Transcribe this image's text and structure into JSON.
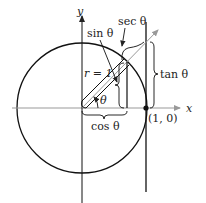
{
  "diagram": {
    "axes": {
      "x_label": "x",
      "y_label": "y"
    },
    "labels": {
      "sin": "sin θ",
      "sec": "sec θ",
      "tan": "tan θ",
      "cos": "cos θ",
      "radius": "r = 1",
      "angle": "θ",
      "point": "(1, 0)"
    },
    "colors": {
      "stroke": "#111111",
      "arrow": "#999999",
      "background": "#ffffff"
    }
  }
}
